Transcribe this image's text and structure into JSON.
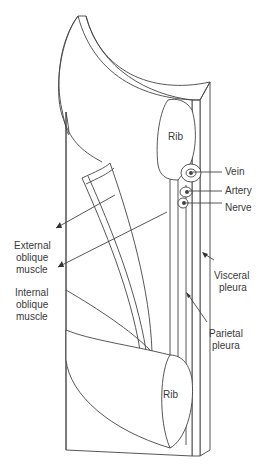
{
  "diagram": {
    "title": "",
    "labels": {
      "rib_top": "Rib",
      "rib_bottom": "Rib",
      "vein": "Vein",
      "artery": "Artery",
      "nerve": "Nerve",
      "external_oblique": [
        "External",
        "oblique",
        "muscle"
      ],
      "internal_oblique": [
        "Internal",
        "oblique",
        "muscle"
      ],
      "visceral_pleura": [
        "Visceral",
        "pleura"
      ],
      "parietal_pleura": [
        "Parietal",
        "pleura"
      ]
    },
    "colors": {
      "line": "#444444",
      "text": "#3a3a3a",
      "background": "#ffffff"
    }
  }
}
